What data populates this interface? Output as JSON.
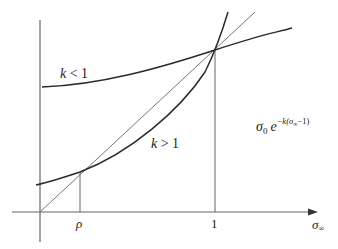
{
  "diagram": {
    "axes": {
      "x_label": "σ∞",
      "x_label_base": "σ",
      "x_label_sub": "∞",
      "x_ticks": [
        {
          "label": "ρ",
          "position": "rho"
        },
        {
          "label": "1",
          "position": "one"
        }
      ]
    },
    "curves": [
      {
        "id": "k-less-1",
        "label": "k < 1",
        "label_k": "k",
        "label_rel": " < 1"
      },
      {
        "id": "k-greater-1",
        "label": "k > 1",
        "label_k": "k",
        "label_rel": " > 1"
      },
      {
        "id": "identity",
        "label": ""
      }
    ],
    "formula": {
      "base": "σ",
      "base_sub": "0",
      "e": "e",
      "exponent": "−k(σ∞−1)",
      "exp_pre": "−k(σ",
      "exp_sub": "∞",
      "exp_post": "−1)"
    },
    "colors": {
      "axis": "#555555",
      "curve": "#2a2a2a",
      "identity": "#666666",
      "guide": "#666666",
      "text": "#222222"
    }
  }
}
